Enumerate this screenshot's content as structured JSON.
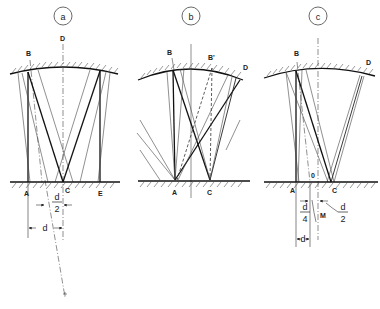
{
  "figure": {
    "panels": [
      {
        "id": "a",
        "badge": "a",
        "points": {
          "B": "B",
          "D": "D",
          "A": "A",
          "C": "C",
          "E": "E"
        },
        "dimensions": {
          "half_num": "d",
          "half_den": "2",
          "full": "d"
        }
      },
      {
        "id": "b",
        "badge": "b",
        "points": {
          "B": "B",
          "Bp": "B'",
          "D": "D",
          "A": "A",
          "C": "C"
        }
      },
      {
        "id": "c",
        "badge": "c",
        "points": {
          "B": "B",
          "D": "D",
          "A": "A",
          "C": "C",
          "O": "0",
          "M": "M"
        },
        "dimensions": {
          "quarter_num": "d",
          "quarter_den": "4",
          "half_num": "d",
          "half_den": "2",
          "full": "d"
        }
      }
    ]
  }
}
